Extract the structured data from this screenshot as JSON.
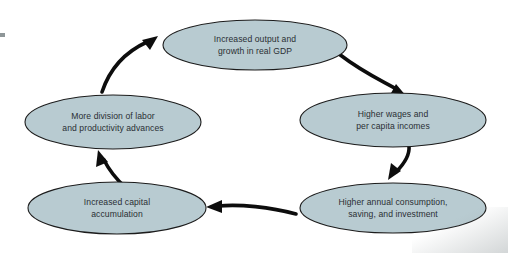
{
  "diagram": {
    "type": "cycle-flow-diagram",
    "background_color": "#ffffff",
    "node_fill_color": "#b8cbd1",
    "node_stroke_color": "#1c1c1c",
    "arrow_color": "#0d0d0d",
    "text_color": "#2a2f33",
    "nodes": [
      {
        "id": "output-growth",
        "position": "top",
        "line1": "Increased output and",
        "line2": "growth in real GDP"
      },
      {
        "id": "wages-incomes",
        "position": "right",
        "line1": "Higher wages and",
        "line2": "per capita incomes"
      },
      {
        "id": "consumption-saving-investment",
        "position": "bottom-right",
        "line1": "Higher annual consumption,",
        "line2": "saving, and investment"
      },
      {
        "id": "capital-accumulation",
        "position": "bottom-left",
        "line1": "Increased capital",
        "line2": "accumulation"
      },
      {
        "id": "division-of-labor",
        "position": "left",
        "line1": "More division of labor",
        "line2": "and productivity advances"
      }
    ],
    "edges": [
      {
        "id": "edge-1",
        "from": "output-growth",
        "to": "wages-incomes",
        "direction": "down-right"
      },
      {
        "id": "edge-2",
        "from": "wages-incomes",
        "to": "consumption-saving-investment",
        "direction": "down-left"
      },
      {
        "id": "edge-3",
        "from": "consumption-saving-investment",
        "to": "capital-accumulation",
        "direction": "left"
      },
      {
        "id": "edge-4",
        "from": "capital-accumulation",
        "to": "division-of-labor",
        "direction": "up-left"
      },
      {
        "id": "edge-5",
        "from": "division-of-labor",
        "to": "output-growth",
        "direction": "up-right"
      }
    ]
  }
}
